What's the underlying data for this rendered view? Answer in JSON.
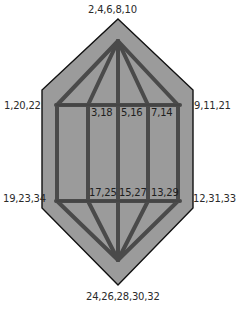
{
  "diagram": {
    "type": "polyhedron-net",
    "colors": {
      "fill": "#9b9b9b",
      "outline": "#111111",
      "frame": "#4a4a4a",
      "text": "#2a2a2a"
    },
    "hexagon": [
      [
        118,
        19
      ],
      [
        193,
        90
      ],
      [
        193,
        208
      ],
      [
        118,
        285
      ],
      [
        42,
        208
      ],
      [
        42,
        90
      ]
    ],
    "apex_top": [
      118,
      41
    ],
    "apex_bottom": [
      118,
      260
    ],
    "frame_columns_x": [
      57,
      88,
      118,
      148,
      178
    ],
    "frame_top_y": 105,
    "frame_bottom_y": 201,
    "labels": {
      "top": "2,4,6,8,10",
      "upper_left": "1,20,22",
      "upper_right": "9,11,21",
      "lower_left": "19,23,34",
      "lower_right": "12,31,33",
      "bottom": "24,26,28,30,32",
      "inner_top": [
        "3,18",
        "5,16",
        "7,14"
      ],
      "inner_bottom": [
        "17,25",
        "15,27",
        "13,29"
      ]
    }
  }
}
